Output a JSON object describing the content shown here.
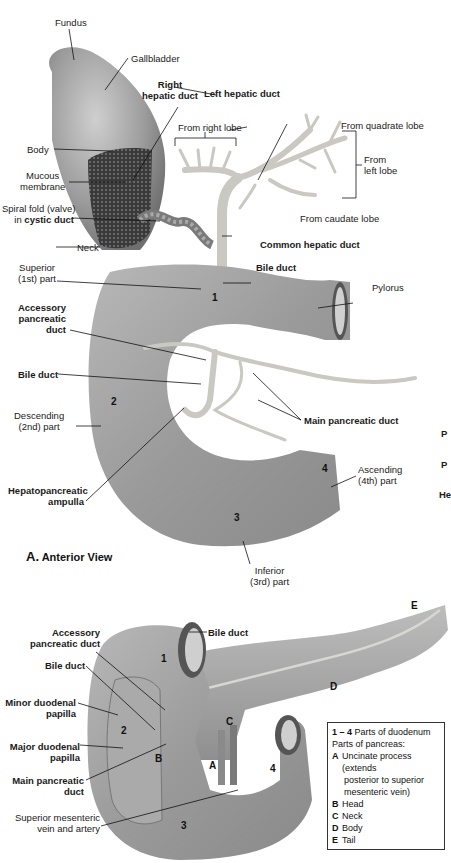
{
  "figure_a": {
    "view_letter": "A.",
    "view_title": "Anterior View",
    "labels": {
      "fundus": "Fundus",
      "gallbladder": "Gallbladder",
      "body": "Body",
      "mucous_membrane_1": "Mucous",
      "mucous_membrane_2": "membrane",
      "spiral_fold_1": "Spiral fold (valve)",
      "spiral_fold_2a": "in ",
      "spiral_fold_2b": "cystic duct",
      "neck": "Neck",
      "right_hepatic_1": "Right",
      "right_hepatic_2": "hepatic duct",
      "left_hepatic": "Left hepatic duct",
      "from_right_lobe": "From right lobe",
      "from_quadrate_lobe": "From quadrate lobe",
      "from_left_lobe_1": "From",
      "from_left_lobe_2": "left lobe",
      "from_caudate_lobe": "From caudate lobe",
      "common_hepatic_duct": "Common hepatic duct",
      "bile_duct_top": "Bile duct",
      "superior_1": "Superior",
      "superior_2": "(1st) part",
      "pylorus": "Pylorus",
      "accessory_1": "Accessory",
      "accessory_2": "pancreatic",
      "accessory_3": "duct",
      "bile_duct_mid": "Bile duct",
      "descending_1": "Descending",
      "descending_2": "(2nd) part",
      "main_pancreatic_duct": "Main pancreatic duct",
      "hepatopancreatic_1": "Hepatopancreatic",
      "hepatopancreatic_2": "ampulla",
      "ascending_1": "Ascending",
      "ascending_2": "(4th) part",
      "inferior_1": "Inferior",
      "inferior_2": "(3rd) part"
    },
    "numbers": [
      "1",
      "2",
      "3",
      "4"
    ],
    "cropped_right_edge": [
      "P",
      "P",
      "He"
    ]
  },
  "figure_b": {
    "labels": {
      "bile_duct": "Bile duct",
      "accessory_1": "Accessory",
      "accessory_2": "pancreatic duct",
      "bile_duct_left": "Bile duct",
      "minor_papilla_1": "Minor duodenal",
      "minor_papilla_2": "papilla",
      "major_papilla_1": "Major duodenal",
      "major_papilla_2": "papilla",
      "main_pancreatic_1": "Main pancreatic",
      "main_pancreatic_2": "duct",
      "sm_vessels_1": "Superior mesenteric",
      "sm_vessels_2": "vein and artery"
    },
    "numbers": [
      "1",
      "2",
      "3",
      "4"
    ],
    "letters": [
      "A",
      "B",
      "C",
      "D",
      "E"
    ]
  },
  "legend": {
    "range_key": "1 – 4",
    "range_text": "Parts of duodenum",
    "pancreas_heading": "Parts of pancreas:",
    "items": [
      {
        "key": "A",
        "text": "Uncinate process (extends",
        "cont": [
          "posterior to superior",
          "mesenteric vein)"
        ]
      },
      {
        "key": "B",
        "text": "Head"
      },
      {
        "key": "C",
        "text": "Neck"
      },
      {
        "key": "D",
        "text": "Body"
      },
      {
        "key": "E",
        "text": "Tail"
      }
    ]
  },
  "colors": {
    "organ_gray": "#9a9a9a",
    "organ_dark": "#6e6e6e",
    "duct_light": "#d6d6d0",
    "leader_line": "#111111"
  }
}
